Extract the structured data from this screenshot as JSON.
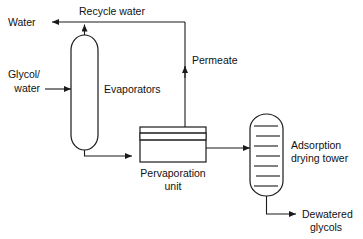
{
  "diagram": {
    "background_color": "#ffffff",
    "line_color": "#1a1a1a",
    "text_color": "#111111",
    "labels": {
      "water": "Water",
      "recycle_water": "Recycle water",
      "glycol_water_line1": "Glycol/",
      "glycol_water_line2": "water",
      "evaporators": "Evaporators",
      "permeate": "Permeate",
      "pervaporation_line1": "Pervaporation",
      "pervaporation_line2": "unit",
      "adsorption_line1": "Adsorption",
      "adsorption_line2": "drying tower",
      "dewatered_line1": "Dewatered",
      "dewatered_line2": "glycols"
    },
    "units": [
      {
        "name": "evaporators",
        "label": "Evaporators",
        "shape": "vertical-capsule-column"
      },
      {
        "name": "pervaporation-unit",
        "label": "Pervaporation unit",
        "shape": "rectangle-with-membrane"
      },
      {
        "name": "adsorption-drying-tower",
        "label": "Adsorption drying tower",
        "shape": "capsule-tower-with-trays",
        "tray_count": 7
      }
    ],
    "streams": [
      {
        "name": "water-outlet",
        "label": "Water",
        "direction": "left"
      },
      {
        "name": "recycle-water",
        "label": "Recycle water",
        "direction": "left"
      },
      {
        "name": "glycol-water-feed",
        "label": "Glycol/water",
        "direction": "right"
      },
      {
        "name": "permeate",
        "label": "Permeate",
        "direction": "up"
      },
      {
        "name": "evaporator-bottoms",
        "label": "",
        "direction": "right"
      },
      {
        "name": "retentate-to-tower",
        "label": "",
        "direction": "right"
      },
      {
        "name": "dewatered-glycols",
        "label": "Dewatered glycols",
        "direction": "right"
      }
    ]
  }
}
